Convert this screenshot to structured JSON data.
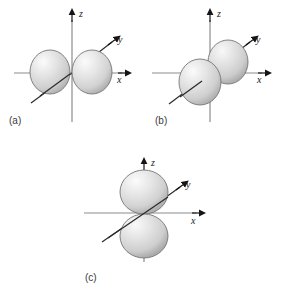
{
  "figure": {
    "background_color": "#ffffff",
    "axis_color": "#8c8c8c",
    "axis_tail_color": "#2b2b2b",
    "arrow_color": "#1a1a1a",
    "lobe_outline_color": "#707070",
    "lobe_light_color": "#f2f2f2",
    "lobe_mid_color": "#d8d8d8",
    "lobe_dark_color": "#a8a8a8"
  },
  "panels": [
    {
      "id": "a",
      "caption": "(a)",
      "orbital": "px",
      "orbital_axis": "x",
      "axis_labels": {
        "x": "x",
        "y": "y",
        "z": "z"
      }
    },
    {
      "id": "b",
      "caption": "(b)",
      "orbital": "py",
      "orbital_axis": "y",
      "axis_labels": {
        "x": "x",
        "y": "y",
        "z": "z"
      }
    },
    {
      "id": "c",
      "caption": "(c)",
      "orbital": "pz",
      "orbital_axis": "z",
      "axis_labels": {
        "x": "x",
        "y": "y",
        "z": "z"
      }
    }
  ]
}
